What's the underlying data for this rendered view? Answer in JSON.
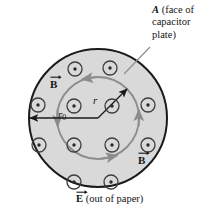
{
  "figure": {
    "type": "physics-diagram",
    "colors": {
      "plate_fill": "#d9d9d9",
      "plate_stroke": "#1a1a1a",
      "field_line": "#8c8c8c",
      "dot_stroke": "#3d3d3d",
      "text": "#141414",
      "leader_line": "#8c8c8c",
      "background": "#ffffff"
    },
    "outer_circle": {
      "name": "capacitor-plate-face",
      "cx": 98,
      "cy": 118,
      "r": 69,
      "stroke_width": 2.0
    },
    "inner_circle": {
      "name": "amperian-loop",
      "cx": 98,
      "cy": 118,
      "r": 41,
      "stroke_width": 1.8
    },
    "field_dots": [
      {
        "cx": 75,
        "cy": 69,
        "r": 7.0
      },
      {
        "cx": 110,
        "cy": 68,
        "r": 7.0
      },
      {
        "cx": 38,
        "cy": 105,
        "r": 7.0
      },
      {
        "cx": 74,
        "cy": 106,
        "r": 7.0
      },
      {
        "cx": 112,
        "cy": 106,
        "r": 7.0
      },
      {
        "cx": 148,
        "cy": 105,
        "r": 7.0
      },
      {
        "cx": 39,
        "cy": 145,
        "r": 7.0
      },
      {
        "cx": 74,
        "cy": 145,
        "r": 7.0
      },
      {
        "cx": 112,
        "cy": 145,
        "r": 7.0
      },
      {
        "cx": 148,
        "cy": 145,
        "r": 7.0
      },
      {
        "cx": 74,
        "cy": 182,
        "r": 7.0
      },
      {
        "cx": 111,
        "cy": 182,
        "r": 7.0
      }
    ],
    "radius_r0": {
      "name": "r0-radius-arrow",
      "from_x": 98,
      "from_y": 118,
      "to_x": 30,
      "to_y": 118,
      "label": "r",
      "subscript": "0"
    },
    "radius_r": {
      "name": "r-radius-arrow",
      "from_x": 98,
      "from_y": 118,
      "to_x": 127,
      "to_y": 89,
      "label": "r"
    },
    "b_labels": [
      {
        "name": "b-label-top",
        "text": "B"
      },
      {
        "name": "b-label-bottom",
        "text": "B"
      }
    ],
    "callout": {
      "name": "plate-face-callout",
      "symbol": "A",
      "text": " (face of capacitor plate)",
      "leader": {
        "x1": 149,
        "y1": 46,
        "x2": 124,
        "y2": 73
      }
    },
    "caption": {
      "name": "e-field-caption",
      "symbol": "E",
      "text": " (out of paper)"
    }
  }
}
